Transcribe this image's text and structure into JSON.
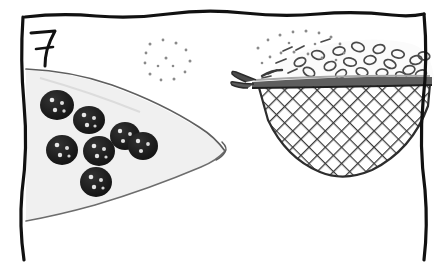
{
  "panel": {
    "number": "7",
    "frame": {
      "style": "hand-drawn wavy ink border, open at bottom",
      "ink_color": "#111111",
      "top_edge_y": 14,
      "left_edge_x": 23,
      "right_edge_x": 424
    },
    "background_color": "#ffffff"
  },
  "objects": {
    "wedge": {
      "name": "triangular-wedge",
      "description": "triangular slice (pie/cake wedge) pointing right, studded with dark berries",
      "fill_color": "#f0f0f0",
      "outline_color": "#6d6d6d",
      "tip_point": [
        225,
        152
      ],
      "berries": {
        "name": "berry",
        "count": 7,
        "fill_color": "#1a1a1a",
        "speckle_color": "#e8e8e8",
        "positions": [
          [
            57,
            105,
            17,
            15
          ],
          [
            89,
            120,
            16,
            14
          ],
          [
            125,
            136,
            15,
            14
          ],
          [
            62,
            150,
            16,
            15
          ],
          [
            99,
            151,
            16,
            15
          ],
          [
            143,
            146,
            15,
            14
          ],
          [
            96,
            182,
            16,
            15
          ]
        ]
      }
    },
    "sieve": {
      "name": "mesh-sieve",
      "description": "mesh strainer basket with a forked handle on the left, holding oval grains",
      "rim": {
        "color": "#5e5e5e",
        "highlight_color": "#a8a8a8",
        "left_x": 252,
        "right_x": 432,
        "y": 80
      },
      "handle": {
        "name": "forked-handle",
        "color": "#4a4a4a",
        "tip_x": 232,
        "y": 74
      },
      "mesh": {
        "color": "#3a3a3a",
        "pattern": "diagonal crosshatch",
        "cell_size": 11,
        "depth_y": 175
      },
      "contents": {
        "name": "grain",
        "description": "small oval rings and dashes heaped above the rim",
        "outline_color": "#4a4a4a",
        "count": 26
      }
    },
    "dot_clusters": {
      "name": "falling-particles",
      "description": "two sparse clusters of small dots suggesting sprinkled powder",
      "color": "#8a8a8a",
      "clusters": [
        {
          "cx": 165,
          "cy": 55,
          "count": 14
        },
        {
          "cx": 295,
          "cy": 45,
          "count": 18
        }
      ]
    }
  }
}
